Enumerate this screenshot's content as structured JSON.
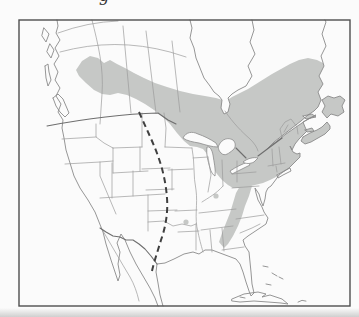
{
  "figure": {
    "type": "species range map",
    "region": "North America (Canada, United States, northern Mexico, Cuba)",
    "cropped_text_fragment": "g",
    "features": {
      "shaded_area": "range band across boreal Canada from British Columbia to Newfoundland, Great Lakes region, New England and Maritimes, extending south along the Appalachians to Georgia",
      "isolated_spots": [
        "small dot in southern Indiana area",
        "small dot in Ozarks (Arkansas/Missouri) area"
      ],
      "dashed_line": "north-south limit line through the Great Plains from the Canadian border to central Texas",
      "water_bodies": [
        "Hudson Bay",
        "James Bay",
        "Lake Superior",
        "Lake Michigan",
        "Lake Huron",
        "Lake Erie",
        "Lake Ontario",
        "Gulf of St. Lawrence",
        "Gulf of Mexico",
        "Gulf of California"
      ]
    },
    "colors": {
      "background": "#fbfbfb",
      "frame": "#4f4f4f",
      "coastline": "#8a8a8a",
      "state_border": "#9b9b9b",
      "international_border": "#6e6e6e",
      "range_fill": "#c6c8c6",
      "water_fill": "#fbfbfb",
      "dashed_line": "#3f3f3f",
      "page_shadow": "#cfcfcf"
    }
  }
}
